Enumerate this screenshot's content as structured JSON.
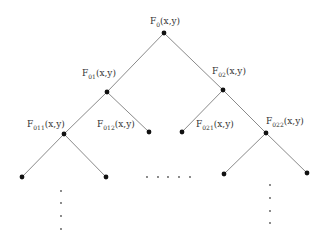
{
  "diagram": {
    "type": "binary-tree",
    "nodes": [
      {
        "id": "F0",
        "base": "F",
        "sub": "0",
        "args": "(x,y)",
        "x": 164,
        "y": 33,
        "label_x": 150,
        "label_y": 24
      },
      {
        "id": "F01",
        "base": "F",
        "sub": "01",
        "args": "(x,y)",
        "x": 107,
        "y": 92,
        "label_x": 82,
        "label_y": 76
      },
      {
        "id": "F02",
        "base": "F",
        "sub": "02",
        "args": "(x,y)",
        "x": 223,
        "y": 90,
        "label_x": 212,
        "label_y": 74
      },
      {
        "id": "F011",
        "base": "F",
        "sub": "011",
        "args": "(x,y)",
        "x": 64,
        "y": 134,
        "label_x": 27,
        "label_y": 127
      },
      {
        "id": "F012",
        "base": "F",
        "sub": "012",
        "args": "(x,y)",
        "x": 149,
        "y": 132,
        "label_x": 97,
        "label_y": 127
      },
      {
        "id": "F021",
        "base": "F",
        "sub": "021",
        "args": "(x,y)",
        "x": 182,
        "y": 132,
        "label_x": 196,
        "label_y": 127
      },
      {
        "id": "F022",
        "base": "F",
        "sub": "022",
        "args": "(x,y)",
        "x": 266,
        "y": 133,
        "label_x": 266,
        "label_y": 124
      }
    ],
    "leaves": [
      {
        "x": 22,
        "y": 177
      },
      {
        "x": 106,
        "y": 177
      },
      {
        "x": 224,
        "y": 174
      },
      {
        "x": 307,
        "y": 173
      }
    ],
    "edges": [
      [
        "F0",
        "F01"
      ],
      [
        "F0",
        "F02"
      ],
      [
        "F01",
        "F011"
      ],
      [
        "F01",
        "F012"
      ],
      [
        "F02",
        "F021"
      ],
      [
        "F02",
        "F022"
      ],
      [
        "F011",
        "leaf0"
      ],
      [
        "F011",
        "leaf1"
      ],
      [
        "F022",
        "leaf2"
      ],
      [
        "F022",
        "leaf3"
      ]
    ],
    "ellipsis_horizontal": [
      [
        147,
        177
      ],
      [
        158,
        177
      ],
      [
        168,
        177
      ],
      [
        179,
        177
      ],
      [
        190,
        177
      ]
    ],
    "ellipsis_left_vertical": [
      [
        61,
        191
      ],
      [
        61,
        203
      ],
      [
        61,
        216
      ],
      [
        61,
        229
      ]
    ],
    "ellipsis_right_vertical": [
      [
        270,
        185
      ],
      [
        270,
        198
      ],
      [
        270,
        211
      ],
      [
        270,
        223
      ]
    ]
  }
}
